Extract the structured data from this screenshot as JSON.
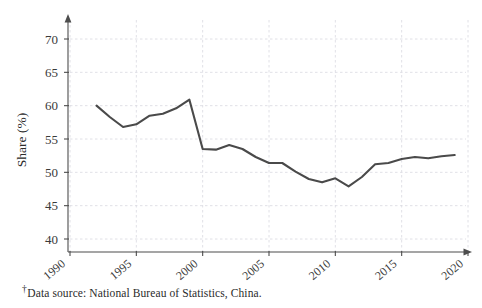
{
  "figure": {
    "background_color": "#ffffff",
    "line_color": "#4a4a4a",
    "grid_color": "#d8d8e0",
    "axis_color": "#4d4d4d",
    "footnote_marker": "†",
    "footnote_text": "Data source: National Bureau of Statistics, China.",
    "ylabel": "Share (%)",
    "xlabel": ""
  },
  "chart_data": {
    "type": "line",
    "title": "",
    "xlabel": "",
    "ylabel": "Share (%)",
    "xlim": [
      1990,
      2020
    ],
    "ylim": [
      38,
      72
    ],
    "xticks": [
      1990,
      1995,
      2000,
      2005,
      2010,
      2015,
      2020
    ],
    "yticks": [
      40,
      45,
      50,
      55,
      60,
      65,
      70
    ],
    "xtick_labels": [
      "1990",
      "1995",
      "2000",
      "2005",
      "2010",
      "2015",
      "2020"
    ],
    "ytick_labels": [
      "40",
      "45",
      "50",
      "55",
      "60",
      "65",
      "70"
    ],
    "grid": true,
    "legend": null,
    "series": [
      {
        "name": "Share (%)",
        "color": "#4a4a4a",
        "x": [
          1992,
          1993,
          1994,
          1995,
          1996,
          1997,
          1998,
          1999,
          2000,
          2001,
          2002,
          2003,
          2004,
          2005,
          2006,
          2007,
          2008,
          2009,
          2010,
          2011,
          2012,
          2013,
          2014,
          2015,
          2016,
          2017,
          2018,
          2019
        ],
        "values": [
          60.0,
          58.3,
          56.8,
          57.2,
          58.5,
          58.8,
          59.6,
          60.9,
          53.5,
          53.4,
          54.1,
          53.5,
          52.3,
          51.4,
          51.4,
          50.1,
          49.0,
          48.5,
          49.1,
          47.9,
          49.3,
          51.2,
          51.4,
          52.0,
          52.3,
          52.1,
          52.4,
          52.6
        ]
      }
    ]
  }
}
